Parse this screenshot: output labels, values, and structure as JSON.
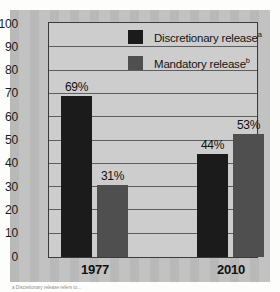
{
  "chart_data": {
    "type": "bar",
    "title": "",
    "xlabel": "",
    "ylabel": "",
    "ylim": [
      0,
      100
    ],
    "ytick_step": 10,
    "yticks": [
      100,
      90,
      80,
      70,
      60,
      50,
      40,
      30,
      20,
      10,
      0
    ],
    "grid": "horizontal",
    "legend_position": "upper-right-inside",
    "categories": [
      "1977",
      "2010"
    ],
    "series": [
      {
        "name": "Discretionary release",
        "footnote_marker": "a",
        "color": "#1b1b1b",
        "values": [
          69,
          44
        ],
        "data_labels": [
          "69%",
          "31%"
        ]
      },
      {
        "name": "Mandatory release",
        "footnote_marker": "b",
        "color": "#4f4f4f",
        "values": [
          31,
          53
        ],
        "data_labels": [
          "44%",
          "53%"
        ]
      }
    ],
    "bars": [
      {
        "group": "1977",
        "series": "Discretionary release",
        "value": 69,
        "label": "69%"
      },
      {
        "group": "1977",
        "series": "Mandatory release",
        "value": 31,
        "label": "31%"
      },
      {
        "group": "2010",
        "series": "Discretionary release",
        "value": 44,
        "label": "44%"
      },
      {
        "group": "2010",
        "series": "Mandatory release",
        "value": 53,
        "label": "53%"
      }
    ]
  },
  "legend": {
    "items": [
      {
        "label": "Discretionary release",
        "marker": "a"
      },
      {
        "label": "Mandatory release",
        "marker": "b"
      }
    ]
  },
  "axis": {
    "y_labels": [
      "100",
      "90",
      "80",
      "70",
      "60",
      "50",
      "40",
      "30",
      "20",
      "10",
      "0"
    ],
    "x_labels": [
      "1977",
      "2010"
    ]
  },
  "labels": {
    "bar_1977_discretionary": "69%",
    "bar_1977_mandatory": "31%",
    "bar_2010_discretionary": "44%",
    "bar_2010_mandatory": "53%"
  },
  "footnote": {
    "text": "a Discretionary release refers to..."
  },
  "colors": {
    "discretionary": "#1b1b1b",
    "mandatory": "#4f4f4f",
    "panel": "#b9b9b9",
    "plot": "#cdcdcd",
    "axis": "#3a3a3a"
  }
}
